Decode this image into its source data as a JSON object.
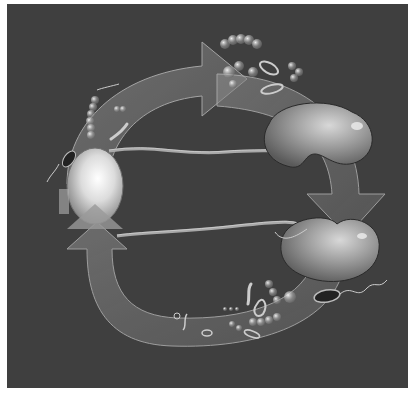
{
  "image": {
    "description": "Grayscale medical illustration of a circular cycle: a bladder on the left, two translucent curved arrows carrying bacteria around a loop, and two kidneys on the right connected to the bladder by ureters.",
    "background_color": "#3f3f3f",
    "page_color": "#ffffff",
    "elements": {
      "bladder": "bladder",
      "kidney_upper": "kidney",
      "kidney_lower": "kidney",
      "arrow_top": "clockwise arrow (top, pointing right)",
      "arrow_right": "arrow pointing down (right side)",
      "arrow_bottom": "arrow sweeping from lower right back up to bladder",
      "bacteria": "bacteria clusters (cocci chains, rods, flagellated bacilli)"
    }
  }
}
